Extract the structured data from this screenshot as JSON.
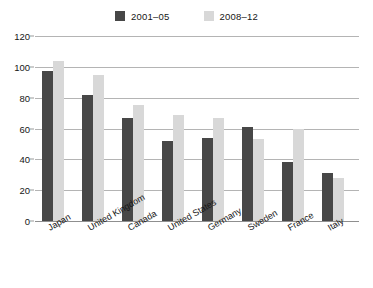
{
  "chart_data": {
    "type": "bar",
    "title": "",
    "subtitle": "",
    "xlabel": "",
    "ylabel": "",
    "ylim": [
      0,
      120
    ],
    "yticks": [
      0,
      20,
      40,
      60,
      80,
      100,
      120
    ],
    "ytick_labels": [
      "0",
      "20",
      "40",
      "60",
      "80",
      "100",
      "120"
    ],
    "grid": true,
    "grid_axis": "y",
    "legend_position": "top-center",
    "orientation": "vertical",
    "grouping": "grouped",
    "categories": [
      "Japan",
      "United Kingdom",
      "Canada",
      "United States",
      "Germany",
      "Sweden",
      "France",
      "Italy"
    ],
    "series": [
      {
        "name": "2001–05",
        "color": "#474747",
        "values": [
          97,
          82,
          67,
          52,
          54,
          61,
          38,
          31
        ]
      },
      {
        "name": "2008–12",
        "color": "#d8d8d8",
        "values": [
          104,
          95,
          75,
          69,
          67,
          53,
          60,
          28
        ]
      }
    ],
    "annotations": []
  },
  "legend": {
    "entries": [
      {
        "label": "2001–05",
        "swatch_name": "legend-swatch-2001-05"
      },
      {
        "label": "2008–12",
        "swatch_name": "legend-swatch-2008-12"
      }
    ]
  },
  "colors": {
    "series_dark": "#474747",
    "series_light": "#d8d8d8",
    "gridline": "#b4b4b4",
    "baseline": "#8f8f8f",
    "text": "#161616",
    "background": "#ffffff"
  }
}
